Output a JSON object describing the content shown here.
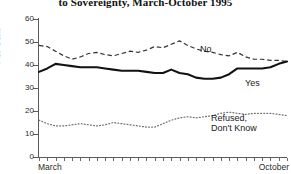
{
  "title": "to Sovereignty, March-October 1995",
  "axes": {
    "ylabel": "Per Cent",
    "yticks": [
      "0",
      "10",
      "20",
      "30",
      "40",
      "50",
      "60"
    ],
    "xlabel_left": "March",
    "xlabel_right": "October"
  },
  "labels": {
    "no": "No",
    "yes": "Yes",
    "refused_line1": "Refused,",
    "refused_line2": "Don't Know"
  },
  "chart_data": {
    "type": "line",
    "title": "to Sovereignty, March-October 1995",
    "xlabel": "",
    "ylabel": "Per Cent",
    "ylim": [
      0,
      60
    ],
    "grid": false,
    "legend": "inline-right",
    "x_tick_count": 31,
    "x_range_labels": [
      "March",
      "October"
    ],
    "series": [
      {
        "name": "No",
        "style": "dashed",
        "color": "#333333",
        "values": [
          48.5,
          48.0,
          46.0,
          44.0,
          42.5,
          43.5,
          45.0,
          45.5,
          44.5,
          44.0,
          45.0,
          46.0,
          45.5,
          46.5,
          48.0,
          47.5,
          49.0,
          50.5,
          48.5,
          47.0,
          46.0,
          45.5,
          44.5,
          44.0,
          45.5,
          43.5,
          42.5,
          42.5,
          42.0,
          42.0,
          41.5
        ]
      },
      {
        "name": "Yes",
        "style": "solid",
        "color": "#1a1a1a",
        "values": [
          37.0,
          38.5,
          40.5,
          40.0,
          39.5,
          39.0,
          39.0,
          39.0,
          38.5,
          38.0,
          37.5,
          37.5,
          37.5,
          37.0,
          36.5,
          36.5,
          38.0,
          36.5,
          36.0,
          34.5,
          34.0,
          34.0,
          34.5,
          36.0,
          38.5,
          38.5,
          38.5,
          38.5,
          39.0,
          40.5,
          41.5
        ]
      },
      {
        "name": "Refused, Don't Know",
        "style": "dotted",
        "color": "#6b6b6b",
        "values": [
          16.0,
          14.5,
          13.5,
          13.5,
          14.0,
          14.5,
          14.0,
          13.5,
          14.0,
          15.0,
          14.5,
          14.0,
          13.5,
          13.0,
          13.0,
          14.5,
          16.0,
          17.0,
          17.5,
          17.0,
          17.5,
          18.0,
          19.0,
          19.5,
          19.0,
          18.5,
          19.0,
          19.0,
          19.0,
          18.5,
          18.0
        ]
      }
    ]
  }
}
